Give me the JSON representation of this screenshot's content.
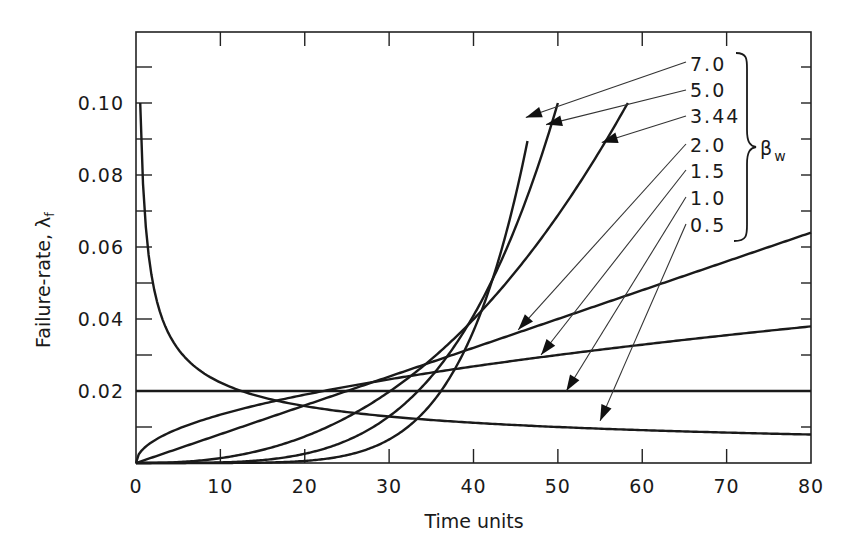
{
  "chart_data": {
    "type": "line",
    "title": "",
    "xlabel": "Time units",
    "ylabel": "Failure-rate, λf",
    "ylabel_main": "Failure-rate, λ",
    "ylabel_sub": "f",
    "xlim": [
      0,
      80
    ],
    "ylim": [
      0,
      0.12
    ],
    "grid": false,
    "x_ticks": [
      0,
      10,
      20,
      30,
      40,
      50,
      60,
      70,
      80
    ],
    "x_tick_labels": [
      "0",
      "10",
      "20",
      "30",
      "40",
      "50",
      "60",
      "70",
      "80"
    ],
    "y_ticks": [
      0.02,
      0.04,
      0.06,
      0.08,
      0.1
    ],
    "y_tick_labels": [
      "0.02",
      "0.04",
      "0.06",
      "0.08",
      "0.10"
    ],
    "y_minor_ticks": [
      0.01,
      0.03,
      0.05,
      0.07,
      0.09,
      0.11
    ],
    "model": "Weibull hazard λ(t) = (β/η)(t/η)^(β−1)",
    "eta": 50,
    "legend": {
      "parameter": "β",
      "parameter_sub": "w",
      "position": "upper right, bracketed",
      "entries": [
        "7.0",
        "5.0",
        "3.44",
        "2.0",
        "1.5",
        "1.0",
        "0.5"
      ]
    },
    "series": [
      {
        "name": "7.0",
        "beta": 7.0,
        "t_range": [
          0,
          46.4
        ],
        "values_at": {
          "t": [
            20,
            30,
            40,
            45,
            46.4
          ],
          "lambda": [
            0.0006,
            0.0065,
            0.0367,
            0.0744,
            0.1
          ]
        }
      },
      {
        "name": "5.0",
        "beta": 5.0,
        "t_range": [
          0,
          50.0
        ],
        "values_at": {
          "t": [
            20,
            30,
            40,
            45,
            50
          ],
          "lambda": [
            0.0026,
            0.013,
            0.041,
            0.0656,
            0.1
          ]
        }
      },
      {
        "name": "3.44",
        "beta": 3.44,
        "t_range": [
          0,
          58.3
        ],
        "values_at": {
          "t": [
            20,
            30,
            40,
            50,
            58.3
          ],
          "lambda": [
            0.0075,
            0.0197,
            0.0399,
            0.0688,
            0.1
          ]
        }
      },
      {
        "name": "2.0",
        "beta": 2.0,
        "t_range": [
          0,
          80
        ],
        "values_at": {
          "t": [
            0,
            20,
            40,
            60,
            80
          ],
          "lambda": [
            0.0,
            0.016,
            0.032,
            0.048,
            0.064
          ]
        }
      },
      {
        "name": "1.5",
        "beta": 1.5,
        "t_range": [
          0,
          80
        ],
        "values_at": {
          "t": [
            0,
            20,
            40,
            60,
            80
          ],
          "lambda": [
            0.0,
            0.019,
            0.0268,
            0.0329,
            0.0379
          ]
        }
      },
      {
        "name": "1.0",
        "beta": 1.0,
        "t_range": [
          0,
          80
        ],
        "values_at": {
          "t": [
            0,
            40,
            80
          ],
          "lambda": [
            0.02,
            0.02,
            0.02
          ]
        }
      },
      {
        "name": "0.5",
        "beta": 0.5,
        "t_range": [
          0.5,
          80
        ],
        "values_at": {
          "t": [
            0.5,
            5,
            10,
            20,
            40,
            80
          ],
          "lambda": [
            0.1,
            0.0316,
            0.0224,
            0.0158,
            0.0112,
            0.0079
          ]
        }
      }
    ],
    "annotations": [
      {
        "label": "7.0",
        "arrow_to_t": 46.2,
        "arrow_to_lambda": 0.096
      },
      {
        "label": "5.0",
        "arrow_to_t": 48.6,
        "arrow_to_lambda": 0.094
      },
      {
        "label": "3.44",
        "arrow_to_t": 55.2,
        "arrow_to_lambda": 0.089
      },
      {
        "label": "2.0",
        "arrow_to_t": 45.3,
        "arrow_to_lambda": 0.037
      },
      {
        "label": "1.5",
        "arrow_to_t": 48.0,
        "arrow_to_lambda": 0.03
      },
      {
        "label": "1.0",
        "arrow_to_t": 51.0,
        "arrow_to_lambda": 0.02
      },
      {
        "label": "0.5",
        "arrow_to_t": 55.0,
        "arrow_to_lambda": 0.0117
      }
    ]
  },
  "layout_colors": {
    "ink": "#1a1a1a",
    "background": "#ffffff"
  }
}
